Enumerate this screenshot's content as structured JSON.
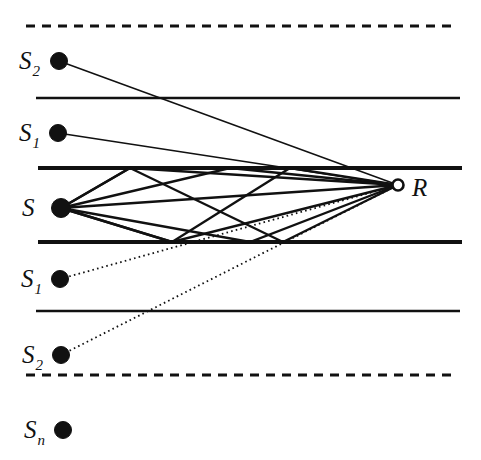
{
  "figure": {
    "width": 481,
    "height": 460,
    "background_color": "#ffffff",
    "ink_color": "#111111"
  },
  "labels": {
    "source": {
      "base": "S",
      "sub": ""
    },
    "receiver": {
      "base": "R",
      "sub": ""
    },
    "image_up_1": {
      "base": "S",
      "sub": "1"
    },
    "image_up_2": {
      "base": "S",
      "sub": "2"
    },
    "image_down_1": {
      "base": "S",
      "sub": "1"
    },
    "image_down_2": {
      "base": "S",
      "sub": "2"
    },
    "image_down_n": {
      "base": "S",
      "sub": "n"
    }
  },
  "chart_data": {
    "type": "diagram",
    "xlim": [
      0,
      481
    ],
    "ylim": [
      0,
      460
    ],
    "grid": false,
    "boundaries": [
      {
        "name": "virtual-boundary-top",
        "y": 26,
        "x0": 26,
        "x1": 455,
        "style": "dashed",
        "width": 3.0
      },
      {
        "name": "mirror-line-upper-outer",
        "y": 98,
        "x0": 36,
        "x1": 460,
        "style": "solid",
        "width": 2.6
      },
      {
        "name": "waveguide-top",
        "y": 168,
        "x0": 38,
        "x1": 462,
        "style": "solid",
        "width": 4.2
      },
      {
        "name": "waveguide-bottom",
        "y": 242,
        "x0": 38,
        "x1": 462,
        "style": "solid",
        "width": 4.2
      },
      {
        "name": "mirror-line-lower-outer",
        "y": 311,
        "x0": 36,
        "x1": 460,
        "style": "solid",
        "width": 2.6
      },
      {
        "name": "virtual-boundary-bottom",
        "y": 375,
        "x0": 26,
        "x1": 455,
        "style": "dashed",
        "width": 3.0
      }
    ],
    "nodes": [
      {
        "name": "source",
        "label": "S",
        "sub": "",
        "x": 61,
        "y": 208,
        "r": 9.5,
        "marker": "filled-dot",
        "label_x": 22,
        "label_y": 216
      },
      {
        "name": "receiver",
        "label": "R",
        "sub": "",
        "x": 398,
        "y": 185,
        "r": 5.5,
        "marker": "open-circle",
        "label_x": 412,
        "label_y": 196
      },
      {
        "name": "image-up-2",
        "label": "S",
        "sub": "2",
        "x": 59,
        "y": 61,
        "r": 8.5,
        "marker": "filled-dot",
        "label_x": 19,
        "label_y": 69
      },
      {
        "name": "image-up-1",
        "label": "S",
        "sub": "1",
        "x": 58,
        "y": 133,
        "r": 8.5,
        "marker": "filled-dot",
        "label_x": 19,
        "label_y": 141
      },
      {
        "name": "image-down-1",
        "label": "S",
        "sub": "1",
        "x": 60,
        "y": 279,
        "r": 8.5,
        "marker": "filled-dot",
        "label_x": 21,
        "label_y": 287
      },
      {
        "name": "image-down-2",
        "label": "S",
        "sub": "2",
        "x": 61,
        "y": 355,
        "r": 8.5,
        "marker": "filled-dot",
        "label_x": 22,
        "label_y": 363
      },
      {
        "name": "image-down-n",
        "label": "S",
        "sub": "n",
        "x": 63,
        "y": 430,
        "r": 8.5,
        "marker": "filled-dot",
        "label_x": 24,
        "label_y": 438
      }
    ],
    "rays": [
      {
        "name": "ray-direct",
        "style": "solid",
        "width": 2.4,
        "points": [
          [
            61,
            208
          ],
          [
            398,
            185
          ]
        ]
      },
      {
        "name": "ray-up-1-bounce",
        "style": "solid",
        "width": 2.4,
        "points": [
          [
            61,
            208
          ],
          [
            130,
            168
          ],
          [
            398,
            185
          ]
        ]
      },
      {
        "name": "ray-down-1-bounce",
        "style": "solid",
        "width": 2.4,
        "points": [
          [
            61,
            208
          ],
          [
            172,
            242
          ],
          [
            398,
            185
          ]
        ]
      },
      {
        "name": "ray-up-then-down",
        "style": "solid",
        "width": 2.4,
        "points": [
          [
            61,
            208
          ],
          [
            130,
            168
          ],
          [
            283,
            242
          ],
          [
            398,
            185
          ]
        ]
      },
      {
        "name": "ray-down-then-up",
        "style": "solid",
        "width": 2.4,
        "points": [
          [
            61,
            208
          ],
          [
            172,
            242
          ],
          [
            290,
            168
          ],
          [
            398,
            185
          ]
        ]
      },
      {
        "name": "ray-up-shallow",
        "style": "solid",
        "width": 2.4,
        "points": [
          [
            61,
            208
          ],
          [
            230,
            168
          ],
          [
            398,
            185
          ]
        ]
      },
      {
        "name": "ray-down-shallow",
        "style": "solid",
        "width": 2.4,
        "points": [
          [
            61,
            208
          ],
          [
            250,
            242
          ],
          [
            398,
            185
          ]
        ]
      },
      {
        "name": "image-ray-up-2",
        "style": "solid",
        "width": 1.5,
        "points": [
          [
            59,
            61
          ],
          [
            398,
            185
          ]
        ]
      },
      {
        "name": "image-ray-up-1",
        "style": "solid",
        "width": 1.5,
        "points": [
          [
            58,
            133
          ],
          [
            398,
            185
          ]
        ]
      },
      {
        "name": "image-ray-down-1",
        "style": "dotted",
        "width": 1.8,
        "points": [
          [
            60,
            279
          ],
          [
            398,
            185
          ]
        ]
      },
      {
        "name": "image-ray-down-2",
        "style": "dotted",
        "width": 1.8,
        "points": [
          [
            61,
            355
          ],
          [
            398,
            185
          ]
        ]
      }
    ]
  }
}
